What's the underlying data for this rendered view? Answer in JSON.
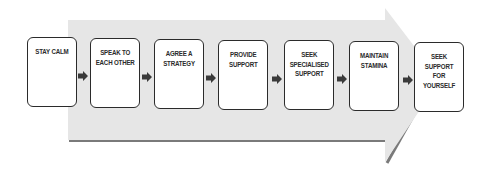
{
  "diagram": {
    "type": "process-flow",
    "background_arrow": {
      "fill": "#e6e6e6",
      "edge_shadow": "#7a7a7a"
    },
    "box_border_color": "#2b2b2b",
    "connector_color": "#3a3a3a",
    "steps": [
      {
        "label": "STAY CALM"
      },
      {
        "label": "SPEAK TO\nEACH OTHER"
      },
      {
        "label": "AGREE A\nSTRATEGY"
      },
      {
        "label": "PROVIDE\nSUPPORT"
      },
      {
        "label": "SEEK\nSPECIALISED\nSUPPORT"
      },
      {
        "label": "MAINTAIN\nSTAMINA"
      },
      {
        "label": "SEEK\nSUPPORT FOR\nYOURSELF"
      }
    ]
  }
}
